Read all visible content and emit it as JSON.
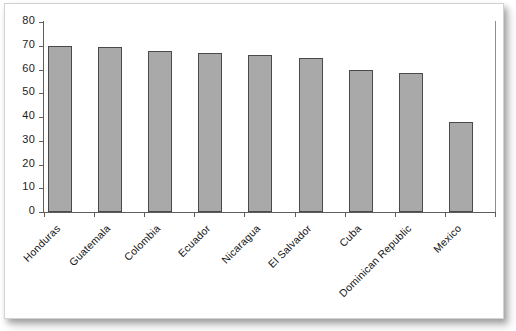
{
  "chart_data": {
    "type": "bar",
    "title": "",
    "subtitle": "",
    "xlabel": "",
    "ylabel": "",
    "categories": [
      "Honduras",
      "Guatemala",
      "Colombia",
      "Ecuador",
      "Nicaragua",
      "El Salvador",
      "Cuba",
      "Dominican Republic",
      "Mexico"
    ],
    "values": [
      70,
      69.5,
      68,
      67,
      66,
      65,
      60,
      58.5,
      38
    ],
    "ylim": [
      0,
      80
    ],
    "yticks": [
      0,
      10,
      20,
      30,
      40,
      50,
      60,
      70,
      80
    ],
    "ytick_labels": [
      "0",
      "10",
      "20",
      "30",
      "40",
      "50",
      "60",
      "70",
      "80"
    ],
    "grid": false,
    "legend": null,
    "legend_position": "none",
    "series": [
      {
        "name": "",
        "values": [
          70,
          69.5,
          68,
          67,
          66,
          65,
          60,
          58.5,
          38
        ]
      }
    ],
    "colors": {
      "bar_fill": "#a9a9a9",
      "bar_edge": "#4a4a4a",
      "axis": "#5d5d5d",
      "text": "#141414",
      "background": "#ffffff"
    }
  }
}
